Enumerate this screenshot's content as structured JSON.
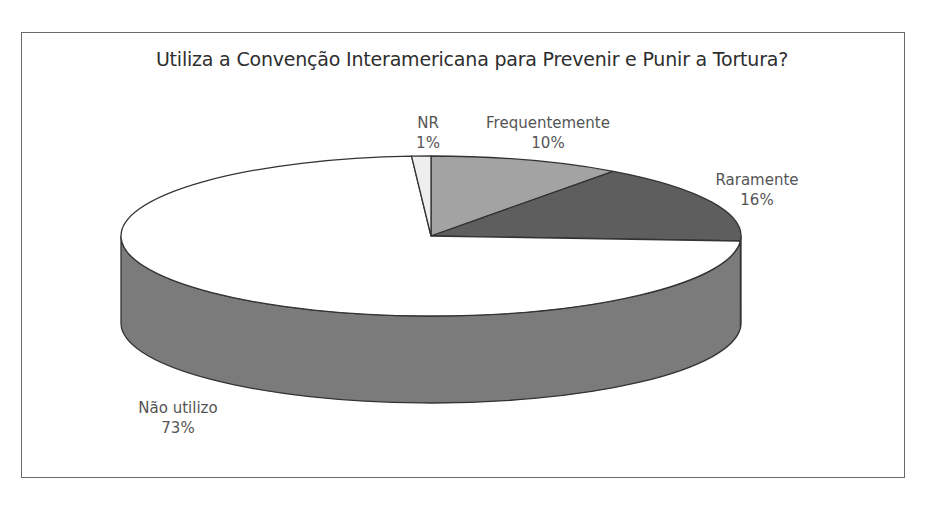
{
  "chart_data": {
    "type": "pie",
    "style": "3d",
    "title": "Utiliza a Convenção Interamericana para Prevenir e Punir a Tortura?",
    "categories": [
      "Frequentemente",
      "Raramente",
      "Não utilizo",
      "NR"
    ],
    "values": [
      10,
      16,
      73,
      1
    ],
    "unit": "%",
    "labels": [
      {
        "name": "Frequentemente",
        "pct": "10%"
      },
      {
        "name": "Raramente",
        "pct": "16%"
      },
      {
        "name": "Não utilizo",
        "pct": "73%"
      },
      {
        "name": "NR",
        "pct": "1%"
      }
    ],
    "colors": [
      "#a3a3a3",
      "#5e5e5e",
      "#ffffff",
      "#eeeeee"
    ],
    "side_colors": [
      "#8a8a8a",
      "#4a4a4a",
      "#7b7b7b",
      "#cfcfcf"
    ],
    "legend": "none (data labels outside slices)"
  }
}
